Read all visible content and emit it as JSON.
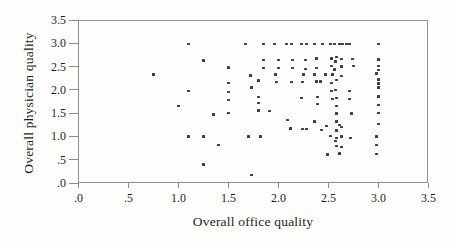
{
  "chart_data": {
    "type": "scatter",
    "title": "",
    "xlabel": "Overall office quality",
    "ylabel": "Overall physician quality",
    "xlim": [
      0,
      3.5
    ],
    "ylim": [
      0,
      3.5
    ],
    "grid": false,
    "legend": "none",
    "x_ticks": [
      ".0",
      ".5",
      "1.0",
      "1.5",
      "2.0",
      "2.5",
      "3.0",
      "3.5"
    ],
    "x_tick_values": [
      0,
      0.5,
      1.0,
      1.5,
      2.0,
      2.5,
      3.0,
      3.5
    ],
    "y_ticks": [
      "3.5",
      "3.0",
      "2.5",
      "2.0",
      "1.5",
      "1.0",
      ".5",
      ".0"
    ],
    "y_tick_values": [
      3.5,
      3.0,
      2.5,
      2.0,
      1.5,
      1.0,
      0.5,
      0
    ],
    "colors": {
      "background": "#fdfdfc",
      "frame": "#8f8f8f",
      "tick": "#8a8a8a",
      "text": "#1d1d1d",
      "marker": "#3c3c3c"
    },
    "marker": "small-square",
    "points": [
      [
        1.1,
        2.98
      ],
      [
        1.67,
        2.98
      ],
      [
        1.85,
        2.98
      ],
      [
        1.96,
        2.98
      ],
      [
        2.08,
        2.98
      ],
      [
        2.13,
        2.98
      ],
      [
        2.23,
        2.98
      ],
      [
        2.28,
        2.98
      ],
      [
        2.36,
        2.98
      ],
      [
        2.44,
        2.98
      ],
      [
        2.52,
        2.98
      ],
      [
        2.56,
        2.98
      ],
      [
        2.61,
        2.98
      ],
      [
        2.64,
        2.98
      ],
      [
        2.68,
        2.98
      ],
      [
        2.71,
        2.98
      ],
      [
        3.0,
        2.98
      ],
      [
        1.25,
        2.63
      ],
      [
        1.85,
        2.64
      ],
      [
        2.0,
        2.64
      ],
      [
        2.14,
        2.64
      ],
      [
        2.27,
        2.64
      ],
      [
        2.38,
        2.67
      ],
      [
        2.53,
        2.67
      ],
      [
        2.58,
        2.7
      ],
      [
        2.57,
        2.61
      ],
      [
        2.63,
        2.66
      ],
      [
        2.74,
        2.66
      ],
      [
        3.0,
        2.65
      ],
      [
        1.5,
        2.48
      ],
      [
        1.85,
        2.47
      ],
      [
        2.0,
        2.47
      ],
      [
        2.14,
        2.47
      ],
      [
        2.27,
        2.45
      ],
      [
        2.38,
        2.47
      ],
      [
        2.53,
        2.51
      ],
      [
        2.56,
        2.44
      ],
      [
        2.63,
        2.5
      ],
      [
        2.75,
        2.51
      ],
      [
        3.0,
        2.51
      ],
      [
        3.0,
        2.43
      ],
      [
        0.75,
        2.33
      ],
      [
        1.72,
        2.31
      ],
      [
        1.97,
        2.33
      ],
      [
        2.25,
        2.33
      ],
      [
        2.36,
        2.33
      ],
      [
        2.47,
        2.33
      ],
      [
        2.54,
        2.33
      ],
      [
        2.63,
        2.3
      ],
      [
        2.98,
        2.35
      ],
      [
        1.5,
        2.15
      ],
      [
        1.8,
        2.2
      ],
      [
        1.98,
        2.17
      ],
      [
        2.13,
        2.17
      ],
      [
        2.24,
        2.17
      ],
      [
        2.38,
        2.18
      ],
      [
        2.42,
        2.18
      ],
      [
        2.53,
        2.15
      ],
      [
        2.58,
        2.21
      ],
      [
        3.0,
        2.22
      ],
      [
        3.0,
        2.14
      ],
      [
        1.1,
        1.98
      ],
      [
        1.5,
        1.95
      ],
      [
        1.73,
        2.05
      ],
      [
        2.53,
        1.98
      ],
      [
        2.57,
        2.0
      ],
      [
        2.71,
        1.98
      ],
      [
        3.0,
        2.05
      ],
      [
        1.5,
        1.78
      ],
      [
        1.8,
        1.85
      ],
      [
        2.23,
        1.83
      ],
      [
        2.39,
        1.84
      ],
      [
        2.54,
        1.81
      ],
      [
        2.58,
        1.82
      ],
      [
        2.71,
        1.81
      ],
      [
        3.0,
        1.86
      ],
      [
        1.0,
        1.65
      ],
      [
        1.8,
        1.72
      ],
      [
        2.39,
        1.7
      ],
      [
        2.58,
        1.65
      ],
      [
        3.0,
        1.68
      ],
      [
        1.35,
        1.47
      ],
      [
        1.5,
        1.5
      ],
      [
        1.8,
        1.56
      ],
      [
        1.91,
        1.55
      ],
      [
        2.58,
        1.49
      ],
      [
        2.73,
        1.49
      ],
      [
        3.0,
        1.5
      ],
      [
        2.09,
        1.35
      ],
      [
        2.36,
        1.32
      ],
      [
        2.58,
        1.32
      ],
      [
        2.12,
        1.17
      ],
      [
        2.24,
        1.16
      ],
      [
        2.28,
        1.16
      ],
      [
        2.43,
        1.14
      ],
      [
        2.48,
        1.22
      ],
      [
        2.58,
        1.13
      ],
      [
        2.61,
        1.25
      ],
      [
        2.63,
        1.2
      ],
      [
        3.0,
        1.27
      ],
      [
        1.1,
        1.0
      ],
      [
        1.25,
        1.0
      ],
      [
        1.7,
        1.0
      ],
      [
        1.82,
        1.0
      ],
      [
        2.52,
        1.01
      ],
      [
        2.58,
        0.97
      ],
      [
        2.63,
        1.0
      ],
      [
        2.72,
        0.97
      ],
      [
        2.98,
        1.0
      ],
      [
        2.57,
        0.9
      ],
      [
        1.4,
        0.82
      ],
      [
        2.58,
        0.8
      ],
      [
        2.63,
        0.77
      ],
      [
        2.98,
        0.82
      ],
      [
        2.49,
        0.61
      ],
      [
        2.61,
        0.63
      ],
      [
        2.98,
        0.62
      ],
      [
        1.25,
        0.4
      ],
      [
        1.73,
        0.17
      ]
    ]
  }
}
